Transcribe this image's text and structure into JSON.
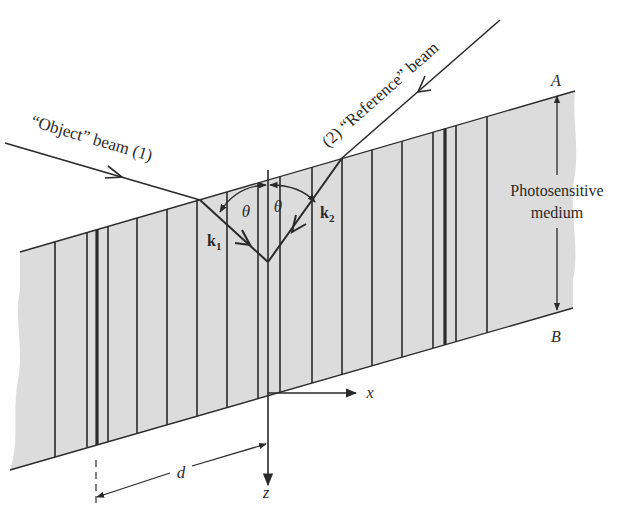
{
  "diagram": {
    "type": "holographic recording geometry",
    "labels": {
      "object_beam": "“Object” beam (1)",
      "reference_beam": "(2) “Reference” beam",
      "medium_line1": "Photosensitive",
      "medium_line2": "medium",
      "face_A": "A",
      "face_B": "B",
      "theta_left": "θ",
      "theta_right": "θ",
      "k1": "k",
      "k1_sub": "1",
      "k2": "k",
      "k2_sub": "2",
      "axis_x": "x",
      "axis_z": "z",
      "spacing_d": "d"
    },
    "colors": {
      "medium_fill": "#dcdcdc",
      "line": "#2a2a2a",
      "background": "#ffffff"
    },
    "fringes": [
      {
        "x": 55,
        "w": 1.6
      },
      {
        "x": 87,
        "w": 1.6
      },
      {
        "x": 97,
        "w": 3.2
      },
      {
        "x": 108,
        "w": 1.6
      },
      {
        "x": 137,
        "w": 1.6
      },
      {
        "x": 167,
        "w": 1.6
      },
      {
        "x": 197,
        "w": 1.6
      },
      {
        "x": 227,
        "w": 1.6
      },
      {
        "x": 258,
        "w": 1.6
      },
      {
        "x": 280,
        "w": 1.6
      },
      {
        "x": 312,
        "w": 1.6
      },
      {
        "x": 342,
        "w": 1.6
      },
      {
        "x": 372,
        "w": 1.6
      },
      {
        "x": 402,
        "w": 1.6
      },
      {
        "x": 433,
        "w": 1.6
      },
      {
        "x": 445,
        "w": 3.2
      },
      {
        "x": 456,
        "w": 1.6
      },
      {
        "x": 487,
        "w": 1.6
      }
    ]
  }
}
